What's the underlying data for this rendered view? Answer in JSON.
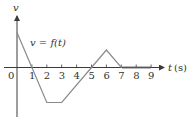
{
  "chart_data": {
    "type": "line",
    "title": "",
    "xlabel": "t (s)",
    "xlabel_var": "t",
    "xlabel_unit": "(s)",
    "ylabel": "v",
    "curve_label": "v = f(t)",
    "x_ticks": [
      "0",
      "1",
      "2",
      "3",
      "4",
      "5",
      "6",
      "7",
      "8",
      "9"
    ],
    "xlim": [
      0,
      9
    ],
    "ylim": [
      -2.5,
      3
    ],
    "grid": false,
    "series": [
      {
        "name": "v = f(t)",
        "x": [
          0,
          1,
          2,
          3,
          5,
          6,
          7,
          9
        ],
        "y": [
          2,
          0,
          -2,
          -2,
          0,
          1,
          0,
          0
        ]
      }
    ],
    "colors": {
      "curve": "#8a8a8a",
      "axis": "#3a3a3a"
    }
  }
}
